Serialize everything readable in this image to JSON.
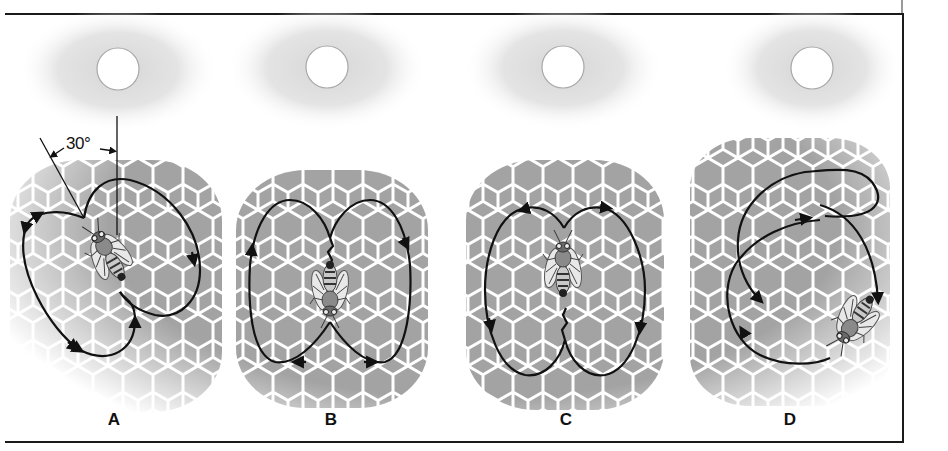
{
  "figure": {
    "frame_color": "#1a1a1a",
    "comb_cell_color": "#a3a3a3",
    "comb_wall_color": "#ffffff",
    "path_color": "#111111",
    "sun_halo_color": "#d9d9d9"
  },
  "panels": [
    {
      "id": "A",
      "label": "A",
      "sun": {
        "cx": 118,
        "cy": 69
      },
      "angle_annotation": "30°",
      "description": "waggle run 30° left of vertical"
    },
    {
      "id": "B",
      "label": "B",
      "sun": {
        "cx": 327,
        "cy": 67
      },
      "description": "waggle run straight down (away from sun)"
    },
    {
      "id": "C",
      "label": "C",
      "sun": {
        "cx": 563,
        "cy": 67
      },
      "description": "waggle run straight up (toward sun)"
    },
    {
      "id": "D",
      "label": "D",
      "sun": {
        "cx": 812,
        "cy": 68
      },
      "description": "round / spiral dance"
    }
  ]
}
